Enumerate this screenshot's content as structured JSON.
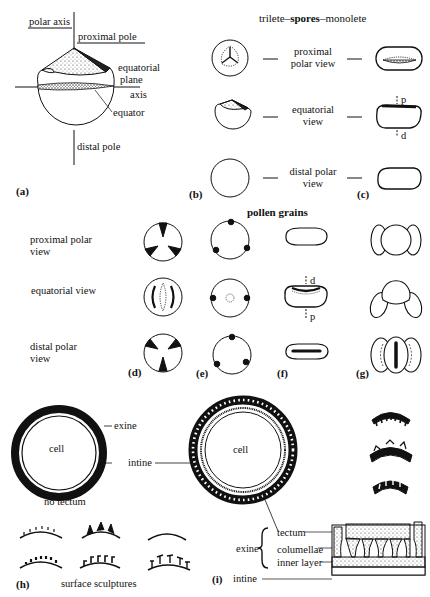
{
  "panel_a": {
    "labels": {
      "polar_axis": "polar axis",
      "proximal_pole": "proximal pole",
      "equatorial_plane_1": "equatorial",
      "equatorial_plane_2": "plane",
      "axis": "axis",
      "equator": "equator",
      "distal_pole": "distal pole"
    },
    "tag": "(a)"
  },
  "spores": {
    "title_left": "trilete–",
    "title_mid": "spores",
    "title_right": "–monolete",
    "views": [
      {
        "line1": "proximal",
        "line2": "polar view"
      },
      {
        "line1": "equatorial",
        "line2": "view"
      },
      {
        "line1": "distal polar",
        "line2": "view"
      }
    ],
    "equatorial_markers": {
      "top": "p",
      "bottom": "d"
    },
    "tag_b": "(b)",
    "tag_c": "(c)"
  },
  "pollen": {
    "title": "pollen grains",
    "row_labels": [
      {
        "line1": "proximal polar",
        "line2": "view"
      },
      {
        "line1": "equatorial view",
        "line2": ""
      },
      {
        "line1": "distal polar",
        "line2": "view"
      }
    ],
    "equatorial_markers": {
      "top": "d",
      "bottom": "p"
    },
    "tags": [
      "(d)",
      "(e)",
      "(f)",
      "(g)"
    ]
  },
  "wall": {
    "left_cell": "cell",
    "exine": "exine",
    "intine": "intine",
    "no_tectum": "no tectum",
    "right_cell": "cell",
    "surface_sculptures": "surface sculptures",
    "tag_h": "(h)",
    "tag_i": "(i)",
    "section": {
      "exine": "exine",
      "tectum": "tectum",
      "columellae": "columellae",
      "inner_layer": "inner layer",
      "intine": "intine"
    }
  }
}
